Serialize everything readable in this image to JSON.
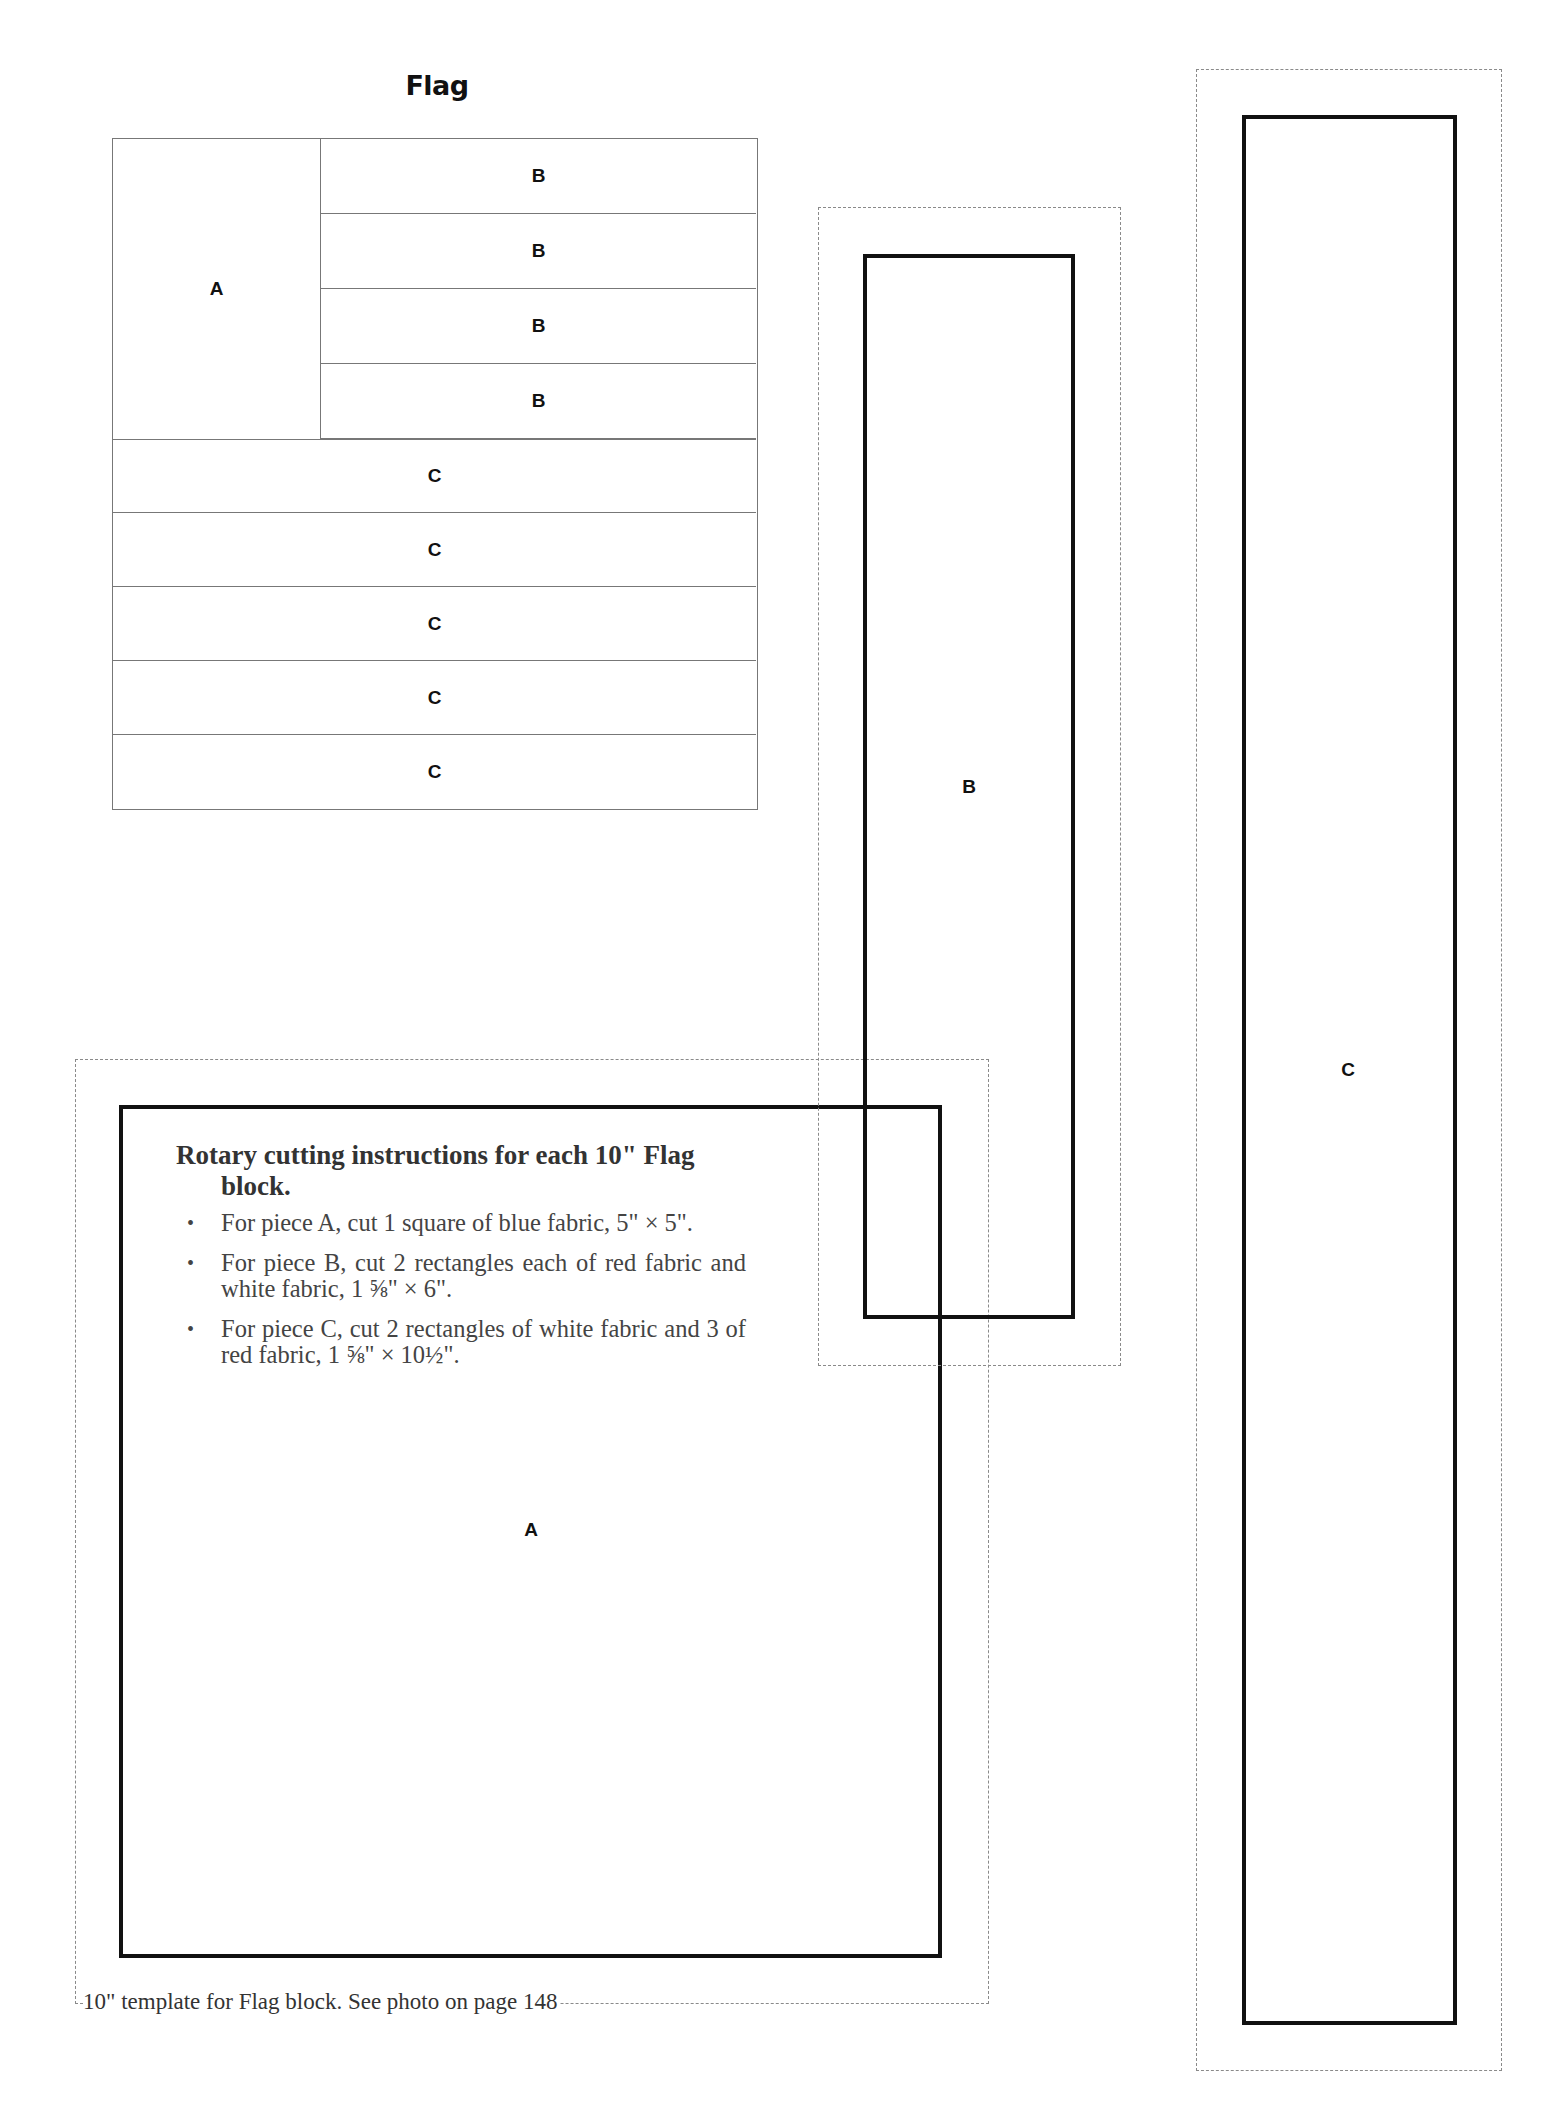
{
  "page": {
    "title": "Flag",
    "caption": "10\" template for Flag block. See photo on page 148"
  },
  "flag_diagram": {
    "cell_a_label": "A",
    "b_rows": [
      "B",
      "B",
      "B",
      "B"
    ],
    "c_rows": [
      "C",
      "C",
      "C",
      "C",
      "C"
    ]
  },
  "templates": {
    "piece_a": {
      "label": "A"
    },
    "piece_b": {
      "label": "B"
    },
    "piece_c": {
      "label": "C"
    }
  },
  "instructions": {
    "heading": "Rotary cutting instructions for each 10\" Flag block.",
    "bullet_symbol": "•",
    "items": [
      "For piece A, cut 1 square of blue fabric, 5\" × 5\".",
      "For piece B, cut 2 rectangles each of red fabric and white fabric, 1 ⅝\" × 6\".",
      "For piece C, cut 2 rectangles of white fabric and 3 of red fabric, 1 ⅝\" × 10½\"."
    ]
  }
}
